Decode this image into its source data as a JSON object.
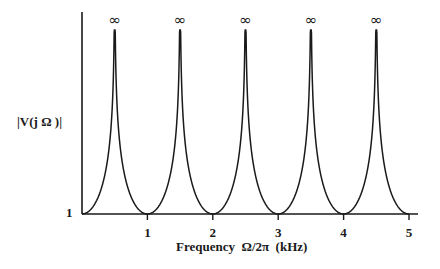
{
  "chart_data": {
    "type": "line",
    "title": "",
    "xlabel": "Frequency  Ω/2π  (kHz)",
    "ylabel": "|V(j Ω )|",
    "x_ticks": [
      "1",
      "2",
      "3",
      "4",
      "5"
    ],
    "y_ticks": [
      "1"
    ],
    "xlim": [
      0,
      5.15
    ],
    "ylim_min_label": "1",
    "peaks": [
      {
        "x": 0.5,
        "label": "∞"
      },
      {
        "x": 1.5,
        "label": "∞"
      },
      {
        "x": 2.5,
        "label": "∞"
      },
      {
        "x": 3.5,
        "label": "∞"
      },
      {
        "x": 4.5,
        "label": "∞"
      }
    ],
    "minima": [
      {
        "x": 0,
        "y": 1
      },
      {
        "x": 1,
        "y": 1
      },
      {
        "x": 2,
        "y": 1
      },
      {
        "x": 3,
        "y": 1
      },
      {
        "x": 4,
        "y": 1
      },
      {
        "x": 5,
        "y": 1
      }
    ],
    "grid": false,
    "line_color": "#1a1a1a"
  }
}
